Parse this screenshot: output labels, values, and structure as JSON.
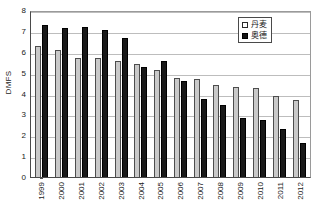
{
  "chart_data": {
    "type": "bar",
    "title": "",
    "xlabel": "",
    "ylabel": "DMFS",
    "ylim": [
      0,
      8
    ],
    "ytick_step": 1,
    "grid": true,
    "legend_position": "top-right",
    "categories": [
      "1999",
      "2000",
      "2001",
      "2002",
      "2003",
      "2004",
      "2005",
      "2006",
      "2007",
      "2008",
      "2009",
      "2010",
      "2011",
      "2012"
    ],
    "yticks": [
      "8",
      "7",
      "6",
      "5",
      "4",
      "3",
      "2",
      "1",
      "0"
    ],
    "series": [
      {
        "name": "丹麦",
        "color": "#c9c9c9",
        "values": [
          6.3,
          6.1,
          5.7,
          5.7,
          5.55,
          5.4,
          5.15,
          4.75,
          4.7,
          4.4,
          4.3,
          4.25,
          3.9,
          3.7
        ]
      },
      {
        "name": "奥德",
        "color": "#191919",
        "values": [
          7.3,
          7.15,
          7.2,
          7.05,
          6.65,
          5.25,
          5.55,
          4.6,
          3.75,
          3.45,
          2.85,
          2.75,
          2.3,
          1.65
        ]
      }
    ]
  },
  "legend": {
    "items": [
      {
        "label": "丹麦"
      },
      {
        "label": "奥德"
      }
    ]
  },
  "colors": {
    "series_a": "#c9c9c9",
    "series_b": "#191919",
    "gridline": "#bdbdbd",
    "axis": "#4a4a4a",
    "background": "#ffffff"
  }
}
